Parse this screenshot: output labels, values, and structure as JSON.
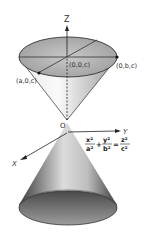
{
  "diagram": {
    "axes": {
      "z": "Z",
      "y": "Y",
      "x": "X",
      "origin": "O"
    },
    "points": {
      "top_center": "(0,0,c)",
      "top_x": "(a,0,c)",
      "top_y": "(0,b,c)"
    },
    "equation": {
      "term1_num": "x²",
      "term1_den": "a²",
      "plus": "+",
      "term2_num": "y²",
      "term2_den": "b²",
      "equals": "=",
      "term3_num": "z²",
      "term3_den": "c²"
    },
    "colors": {
      "ellipse_top": "#b5b5b5",
      "cone_dark": "#555555",
      "cone_light": "#f2f2f2",
      "line": "#222222"
    }
  }
}
